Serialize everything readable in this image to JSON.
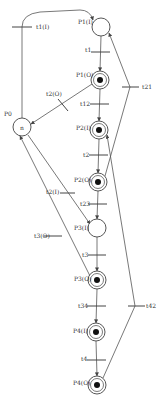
{
  "diagram": {
    "type": "petri-net",
    "places": [
      {
        "id": "P0",
        "label": "P0",
        "inner_label": "n",
        "x": 22,
        "y": 127,
        "marked": false,
        "double": false
      },
      {
        "id": "P1I",
        "label": "P1(I)",
        "x": 101,
        "y": 27,
        "marked": false,
        "double": false
      },
      {
        "id": "P1O",
        "label": "P1(O)",
        "x": 100,
        "y": 80,
        "marked": true,
        "double": true
      },
      {
        "id": "P2I",
        "label": "P2(I)",
        "x": 99,
        "y": 130,
        "marked": true,
        "double": true
      },
      {
        "id": "P2O",
        "label": "P2(O)",
        "x": 98,
        "y": 182,
        "marked": true,
        "double": true
      },
      {
        "id": "P3I",
        "label": "P3(I)",
        "x": 97,
        "y": 228,
        "marked": false,
        "double": false
      },
      {
        "id": "P3O",
        "label": "P3(O)",
        "x": 97,
        "y": 280,
        "marked": true,
        "double": true
      },
      {
        "id": "P4I",
        "label": "P4(I)",
        "x": 96,
        "y": 332,
        "marked": true,
        "double": true
      },
      {
        "id": "P4O",
        "label": "P4(O)",
        "x": 97,
        "y": 385,
        "marked": true,
        "double": true
      }
    ],
    "transitions": [
      {
        "id": "t1I",
        "label": "t1(I)"
      },
      {
        "id": "t1",
        "label": "t1"
      },
      {
        "id": "t2O",
        "label": "t2(O)"
      },
      {
        "id": "t12",
        "label": "t12"
      },
      {
        "id": "t21",
        "label": "t21"
      },
      {
        "id": "t2",
        "label": "t2"
      },
      {
        "id": "t2I",
        "label": "t2(I)"
      },
      {
        "id": "t23",
        "label": "t23"
      },
      {
        "id": "t3O",
        "label": "t3(O)"
      },
      {
        "id": "t3",
        "label": "t3"
      },
      {
        "id": "t34",
        "label": "t34"
      },
      {
        "id": "t42",
        "label": "t42"
      },
      {
        "id": "t4",
        "label": "t4"
      }
    ]
  }
}
